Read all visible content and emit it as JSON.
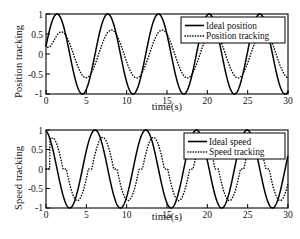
{
  "figure": {
    "background": "#ffffff",
    "ink_color": "#000000"
  },
  "panels": [
    {
      "id": "position",
      "ylabel": "Position tracking",
      "xlabel": "time(s)",
      "legend": [
        {
          "label": "Ideal position",
          "style": "solid"
        },
        {
          "label": "Position tracking",
          "style": "dotted"
        }
      ],
      "xticks": [
        "0",
        "5",
        "10",
        "15",
        "20",
        "25",
        "30"
      ],
      "yticks": [
        "1",
        "0.5",
        "0",
        "-0.5",
        "-1"
      ]
    },
    {
      "id": "speed",
      "ylabel": "Speed tracking",
      "xlabel": "time(s)",
      "legend": [
        {
          "label": "Ideal speed",
          "style": "solid"
        },
        {
          "label": "Speed tracking",
          "style": "dotted"
        }
      ],
      "xticks": [
        "0",
        "5",
        "10",
        "15",
        "20",
        "25",
        "30"
      ],
      "yticks": [
        "1",
        "0.5",
        "0",
        "-0.5",
        "-1"
      ]
    }
  ],
  "chart_data": [
    {
      "type": "line",
      "id": "position-tracking-plot",
      "title": "",
      "xlabel": "time(s)",
      "ylabel": "Position tracking",
      "xlim": [
        0,
        30
      ],
      "ylim": [
        -1,
        1
      ],
      "xticks": [
        0,
        5,
        10,
        15,
        20,
        25,
        30
      ],
      "yticks": [
        -1,
        -0.5,
        0,
        0.5,
        1
      ],
      "grid": false,
      "legend_position": "upper-right",
      "series": [
        {
          "name": "Ideal position",
          "style": "solid",
          "color": "#000000",
          "description": "sin(t + 0.2) amplitude 1, period 6.28 s",
          "model": {
            "amplitude": 1.0,
            "omega": 1.0,
            "phase": 0.2,
            "offset": 0
          },
          "x": [
            0,
            0.5,
            1,
            1.37,
            2,
            2.5,
            3,
            3.5,
            4,
            4.5,
            4.94,
            5.5,
            6,
            6.5,
            7,
            7.5,
            7.65,
            8,
            8.5,
            9,
            9.5,
            10,
            10.5,
            11.08,
            11.5,
            12,
            12.5,
            13,
            13.5,
            13.93,
            14.5,
            15,
            15.5,
            16,
            16.5,
            17,
            17.37,
            18,
            18.5,
            19,
            19.5,
            20,
            20.22,
            21,
            21.5,
            22,
            22.5,
            23,
            23.5,
            23.65,
            24.5,
            25,
            25.5,
            26,
            26.5,
            26.5,
            27,
            27.5,
            28,
            28.5,
            29,
            29.5,
            30
          ],
          "y": [
            0.199,
            0.646,
            0.932,
            1.0,
            0.974,
            0.783,
            0.463,
            0.059,
            -0.361,
            -0.717,
            -1.0,
            -0.938,
            -0.695,
            -0.335,
            0.07,
            0.473,
            0.58,
            0.79,
            0.976,
            1.0,
            0.856,
            0.565,
            0.176,
            -1.0,
            -0.86,
            -0.986,
            -0.94,
            -0.729,
            -0.392,
            -1.0,
            0.51,
            0.835,
            0.992,
            0.958,
            0.737,
            0.373,
            -1.0,
            -0.535,
            -0.845,
            -0.994,
            -0.95,
            -0.718,
            1.0,
            0.03,
            0.447,
            0.772,
            0.969,
            0.99,
            0.833,
            1.0,
            -0.018,
            -0.434,
            -0.763,
            -0.965,
            -0.991,
            1.0,
            -0.841,
            -0.514,
            -0.081,
            0.354,
            0.714,
            0.934,
            0.988
          ]
        },
        {
          "name": "Position tracking",
          "style": "dotted",
          "color": "#000000",
          "description": "lagging, attenuated response; amplitude about 0.6, slight phase lag behind ideal",
          "model": {
            "amplitude": 0.6,
            "omega": 1.0,
            "phase": -0.25,
            "offset": 0
          },
          "peak_value": 0.6,
          "trough_value": -0.6
        }
      ]
    },
    {
      "type": "line",
      "id": "speed-tracking-plot",
      "title": "",
      "xlabel": "time(s)",
      "ylabel": "Speed tracking",
      "xlim": [
        0,
        30
      ],
      "ylim": [
        -1,
        1
      ],
      "xticks": [
        0,
        5,
        10,
        15,
        20,
        25,
        30
      ],
      "yticks": [
        -1,
        -0.5,
        0,
        0.5,
        1
      ],
      "grid": false,
      "legend_position": "upper-right",
      "series": [
        {
          "name": "Ideal speed",
          "style": "solid",
          "color": "#000000",
          "description": "cos(t + 0.2) amplitude 1, period 6.28 s, starts at 1",
          "model": {
            "amplitude": 1.0,
            "omega": 1.0,
            "phase": 1.77,
            "offset": 0
          },
          "peaks_at": [
            0,
            6.3,
            12.6,
            18.9,
            25.1
          ],
          "troughs_at": [
            3.1,
            9.4,
            15.7,
            22.0,
            28.3
          ]
        },
        {
          "name": "Speed tracking",
          "style": "dotted",
          "color": "#000000",
          "description": "attenuated and delayed speed response with flat plateau segments near zero around each zero crossing; peak about 0.9, trough about -0.85",
          "model": {
            "amplitude": 0.88,
            "omega": 1.0,
            "phase": 1.2,
            "offset": 0
          },
          "peak_value": 0.9,
          "trough_value": -0.85,
          "plateau_value": 0.0
        }
      ]
    }
  ]
}
